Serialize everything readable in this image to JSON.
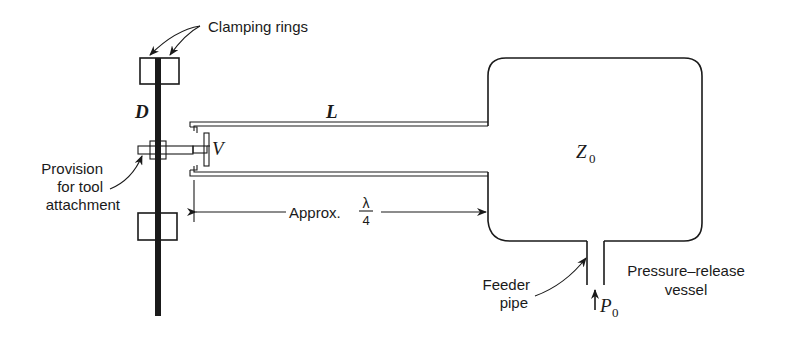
{
  "figure": {
    "labels": {
      "clamping_rings": "Clamping rings",
      "provision_line1": "Provision",
      "provision_line2": "for tool",
      "provision_line3": "attachment",
      "approx": "Approx.",
      "lambda": "λ",
      "four": "4",
      "feeder_line1": "Feeder",
      "feeder_line2": "pipe",
      "vessel_line1": "Pressure–release",
      "vessel_line2": "vessel"
    },
    "symbols": {
      "D": "D",
      "L": "L",
      "V": "V",
      "Z": "Z",
      "Z_sub": "0",
      "P": "P",
      "P_sub": "0"
    },
    "colors": {
      "ink": "#1a1a1a",
      "background": "#ffffff"
    }
  }
}
